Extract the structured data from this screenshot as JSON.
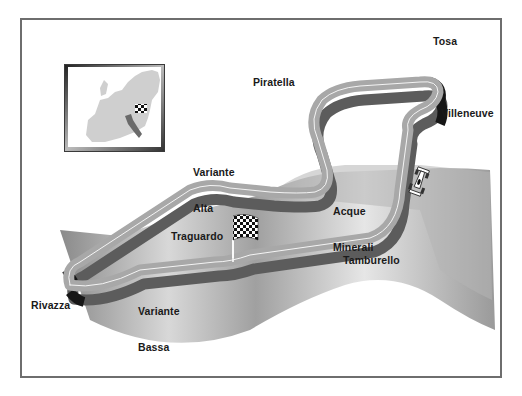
{
  "map": {
    "title": "Circuit map",
    "frame_color": "#6e6e6e",
    "track_color": "#a7a7a7",
    "track_shadow_color": "#5e5e5e",
    "kerb_color": "#1a1a1a",
    "ground_color": "#9a9a9a"
  },
  "labels": {
    "tosa": "Tosa",
    "piratella": "Piratella",
    "villeneuve": "Villeneuve",
    "variante_alta_line1": "Variante",
    "variante_alta_line2": "Alta",
    "acque_minerali_line1": "Acque",
    "acque_minerali_line2": "Minerali",
    "traguardo": "Traguardo",
    "tamburello": "Tamburello",
    "rivazza": "Rivazza",
    "variante_bassa_line1": "Variante",
    "variante_bassa_line2": "Bassa"
  },
  "inset": {
    "region": "Europe",
    "highlighted_country": "Italy",
    "marker": "checkered-flag-icon"
  },
  "icons": {
    "start_finish": "checkered-flag-icon",
    "car": "race-car-icon"
  }
}
